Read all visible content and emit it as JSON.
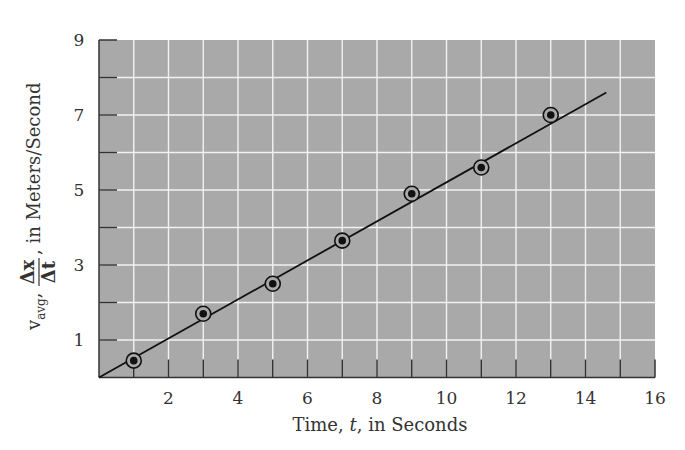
{
  "chart_data": {
    "type": "scatter",
    "title": "",
    "xlabel": "Time, t, in Seconds",
    "ylabel": "v_avg, Δx/Δt, in Meters/Second",
    "xlim": [
      0,
      16
    ],
    "ylim": [
      0,
      9
    ],
    "x_ticks": [
      2,
      4,
      6,
      8,
      10,
      12,
      14,
      16
    ],
    "y_ticks": [
      1,
      3,
      5,
      7,
      9
    ],
    "grid": true,
    "grid_step_x": 1,
    "grid_step_y": 1,
    "legend": null,
    "series": [
      {
        "name": "measured average velocity",
        "marker": "circled-dot",
        "x": [
          1,
          3,
          5,
          7,
          9,
          11,
          13
        ],
        "y": [
          0.45,
          1.7,
          2.5,
          3.65,
          4.9,
          5.6,
          7.0
        ]
      },
      {
        "name": "best-fit line",
        "type": "line",
        "x": [
          0,
          14.6
        ],
        "y": [
          0,
          7.6
        ]
      }
    ]
  },
  "labels": {
    "xlabel_prefix": "Time, ",
    "xlabel_var": "t",
    "xlabel_suffix": ", in Seconds",
    "ylabel_v": "v",
    "ylabel_sub": "avg",
    "ylabel_num": "Δx",
    "ylabel_den": "Δt",
    "ylabel_suffix": ", in Meters/Second"
  },
  "colors": {
    "plot_bg": "#a9a9a9",
    "grid": "#f2f2f2",
    "ink": "#111111"
  }
}
